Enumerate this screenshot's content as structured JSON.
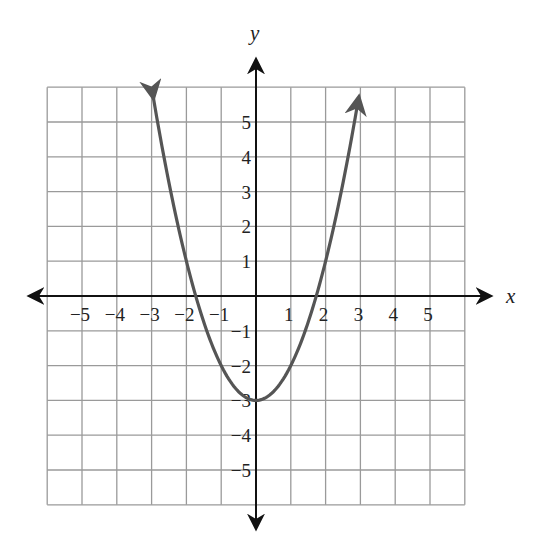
{
  "chart_data": {
    "type": "line",
    "title": "",
    "xlabel": "x",
    "ylabel": "y",
    "xlim": [
      -6,
      6
    ],
    "ylim": [
      -6,
      6
    ],
    "grid": true,
    "x_ticks": [
      -5,
      -4,
      -3,
      -2,
      -1,
      1,
      2,
      3,
      4,
      5
    ],
    "y_ticks": [
      -5,
      -4,
      -3,
      -2,
      -1,
      1,
      2,
      3,
      4,
      5
    ],
    "x_tick_labels": [
      "−5",
      "−4",
      "−3",
      "−2",
      "−1",
      "1",
      "2",
      "3",
      "4",
      "5"
    ],
    "y_tick_labels": [
      "−5",
      "−4",
      "−3",
      "−2",
      "−1",
      "1",
      "2",
      "3",
      "4",
      "5"
    ],
    "series": [
      {
        "name": "y = x^2 - 3",
        "equation": "y = x^2 - 3",
        "x": [
          -2.95,
          -2.5,
          -2,
          -1.5,
          -1.73,
          -1,
          -0.5,
          0,
          0.5,
          1,
          1.73,
          1.5,
          2,
          2.5,
          2.95
        ],
        "y": [
          5.7,
          3.25,
          1,
          -0.75,
          0,
          -2,
          -2.75,
          -3,
          -2.75,
          -2,
          0,
          -0.75,
          1,
          3.25,
          5.7
        ],
        "vertex": [
          0,
          -3
        ],
        "x_intercepts": [
          -1.73,
          1.73
        ],
        "y_intercept": -3,
        "end_arrows": true,
        "color": "#555555"
      }
    ],
    "colors": {
      "curve": "#555555",
      "grid": "#9a9a9a",
      "axes": "#111111"
    }
  },
  "axes": {
    "x_label": "x",
    "y_label": "y"
  }
}
